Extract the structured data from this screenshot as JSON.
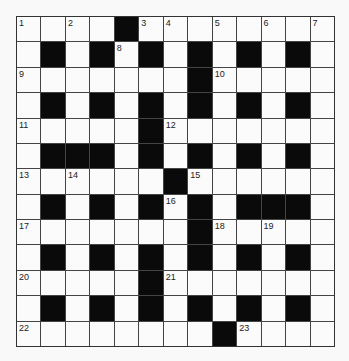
{
  "puzzle": {
    "rows": 13,
    "cols": 13,
    "layout": [
      "....#........",
      ".#.#.#.#.#.#.",
      ".......#.....",
      ".#.#.#.#.#.#.",
      ".....#.......",
      ".###.#.#.#.#.",
      "......#......",
      ".#.#.#.#.###.",
      ".......#.....",
      ".#.#.#.#.#.#.",
      ".....#.......",
      ".#.#.#.#.#.#.",
      "........#...."
    ],
    "numbers": [
      {
        "r": 0,
        "c": 0,
        "n": "1"
      },
      {
        "r": 0,
        "c": 2,
        "n": "2"
      },
      {
        "r": 0,
        "c": 5,
        "n": "3"
      },
      {
        "r": 0,
        "c": 6,
        "n": "4"
      },
      {
        "r": 0,
        "c": 8,
        "n": "5"
      },
      {
        "r": 0,
        "c": 10,
        "n": "6"
      },
      {
        "r": 0,
        "c": 12,
        "n": "7"
      },
      {
        "r": 1,
        "c": 4,
        "n": "8"
      },
      {
        "r": 2,
        "c": 0,
        "n": "9"
      },
      {
        "r": 2,
        "c": 8,
        "n": "10"
      },
      {
        "r": 4,
        "c": 0,
        "n": "11"
      },
      {
        "r": 4,
        "c": 6,
        "n": "12"
      },
      {
        "r": 6,
        "c": 0,
        "n": "13"
      },
      {
        "r": 6,
        "c": 2,
        "n": "14"
      },
      {
        "r": 6,
        "c": 7,
        "n": "15"
      },
      {
        "r": 7,
        "c": 6,
        "n": "16"
      },
      {
        "r": 8,
        "c": 0,
        "n": "17"
      },
      {
        "r": 8,
        "c": 8,
        "n": "18"
      },
      {
        "r": 8,
        "c": 10,
        "n": "19"
      },
      {
        "r": 10,
        "c": 0,
        "n": "20"
      },
      {
        "r": 10,
        "c": 6,
        "n": "21"
      },
      {
        "r": 12,
        "c": 0,
        "n": "22"
      },
      {
        "r": 12,
        "c": 9,
        "n": "23"
      }
    ],
    "colors": {
      "block": "#0a0a0a",
      "cell": "#fbfbfb",
      "line": "#444444"
    }
  }
}
